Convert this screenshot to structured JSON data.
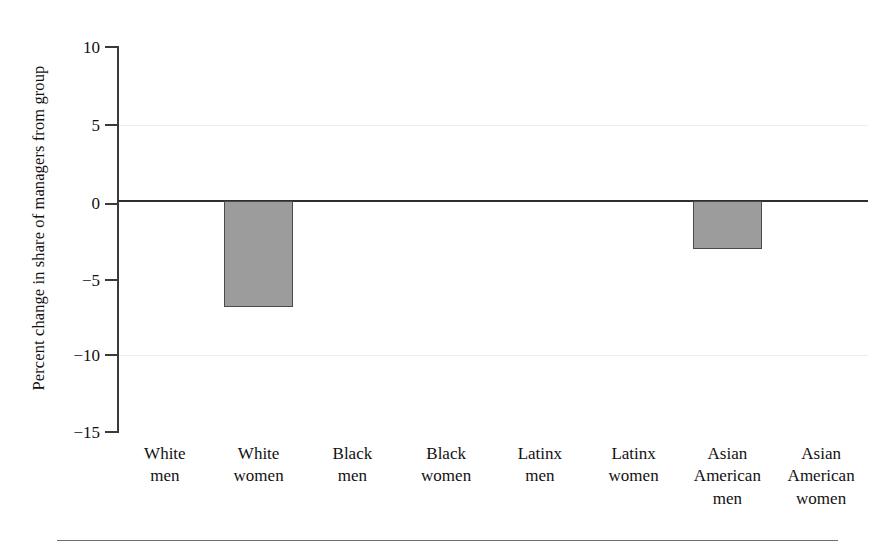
{
  "figure": {
    "background_color": "#ffffff",
    "axis_color": "#3a3a3a",
    "zero_line_color": "#2e2e2e",
    "grid_color": "#ededed",
    "bar_fill_color": "#9c9c9c",
    "bar_edge_color": "#4a4a4a",
    "bottom_rule_color": "#6e6e6e"
  },
  "chart_data": {
    "type": "bar",
    "title": "",
    "subtitle": "",
    "xlabel": "",
    "ylabel": "Percent change in share of managers from group",
    "categories": [
      "White men",
      "White women",
      "Black men",
      "Black women",
      "Latinx men",
      "Latinx women",
      "Asian American men",
      "Asian American women"
    ],
    "category_lines": [
      [
        "White",
        "men"
      ],
      [
        "White",
        "women"
      ],
      [
        "Black",
        "men"
      ],
      [
        "Black",
        "women"
      ],
      [
        "Latinx",
        "men"
      ],
      [
        "Latinx",
        "women"
      ],
      [
        "Asian",
        "American",
        "men"
      ],
      [
        "Asian",
        "American",
        "women"
      ]
    ],
    "values": [
      0,
      -6.9,
      0,
      0,
      0,
      0,
      -3.1,
      0
    ],
    "ylim": [
      -15,
      10
    ],
    "yticks": [
      10,
      5,
      0,
      -5,
      -10,
      -15
    ],
    "ytick_labels": [
      "10",
      "5",
      "0",
      "−5",
      "−10",
      "−15"
    ],
    "gridlines_at": [
      5,
      -10
    ],
    "grid": "faint-horizontal",
    "legend": "none",
    "legend_position": "none",
    "zero_reference_line": 0
  }
}
